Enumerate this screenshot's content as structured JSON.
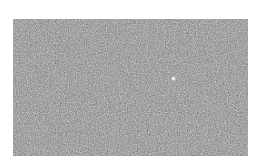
{
  "image": {
    "description": "Grainy grayscale noise texture with a single bright speck",
    "background_color": "#ffffff",
    "texture_base_color": "#8a8a8a",
    "bright_spot": {
      "x": 173,
      "y": 78,
      "color": "#f4f4f4"
    }
  }
}
